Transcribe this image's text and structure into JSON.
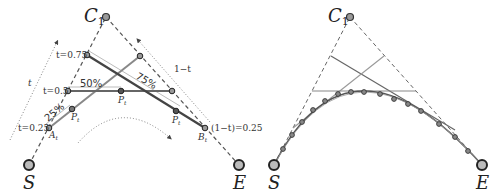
{
  "left_panel": {
    "control_point_label": "C",
    "control_point_sub": "1",
    "start_label": "S",
    "end_label": "E",
    "t_arrow_label": "t",
    "one_minus_t_label": "1−t",
    "t_labels": [
      "t=0.75",
      "t=0.5",
      "t=0.25"
    ],
    "end_t_label": "(1−t)=0.25",
    "percent_labels": [
      "25%",
      "50%",
      "75%"
    ],
    "point_labels": {
      "A": "A",
      "A_sub": "t",
      "B": "B",
      "B_sub": "t",
      "P": "P",
      "P_sub": "t"
    }
  },
  "right_panel": {
    "control_point_label": "C",
    "control_point_sub": "1",
    "start_label": "S",
    "end_label": "E",
    "curve_point_count": 17
  },
  "colors": {
    "dark_line": "#444444",
    "mid_line": "#777777",
    "light_line": "#999999",
    "point_fill": "#888888",
    "background": "#ffffff"
  }
}
